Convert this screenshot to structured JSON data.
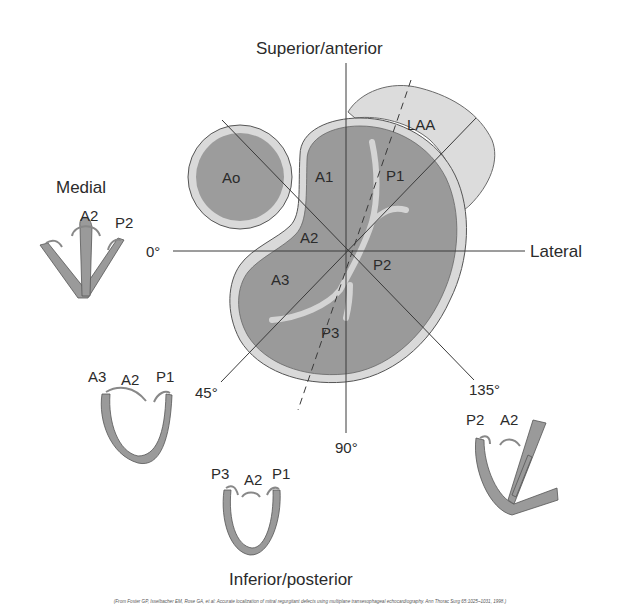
{
  "figure": {
    "title_top": "Superior/anterior",
    "title_bottom": "Inferior/posterior",
    "label_left": "Medial",
    "label_right": "Lateral",
    "angles": {
      "a0": "0°",
      "a45": "45°",
      "a90": "90°",
      "a135": "135°"
    },
    "structures": {
      "aorta": "Ao",
      "left_atrial_appendage": "LAA"
    },
    "segments": {
      "A1": "A1",
      "A2": "A2",
      "A3": "A3",
      "P1": "P1",
      "P2": "P2",
      "P3": "P3"
    },
    "views": {
      "view_0": {
        "labels": [
          "A2",
          "P2"
        ]
      },
      "view_45": {
        "labels": [
          "A3",
          "A2",
          "P1"
        ]
      },
      "view_90": {
        "labels": [
          "P3",
          "A2",
          "P1"
        ]
      },
      "view_135": {
        "labels": [
          "P2",
          "A2"
        ]
      }
    },
    "colors": {
      "leaflet_fill": "#9a9a9a",
      "rim_fill": "#d9d9d9",
      "laa_fill": "#dcdcdc",
      "line": "#3a3a3a"
    },
    "caption": "(From Foster GP, Isselbacher EM, Rose GA, et al: Accurate localization of mitral regurgitant defects using multiplane transesophageal echocardiography. Ann Thorac Surg 65:1025–1031, 1998.)"
  }
}
